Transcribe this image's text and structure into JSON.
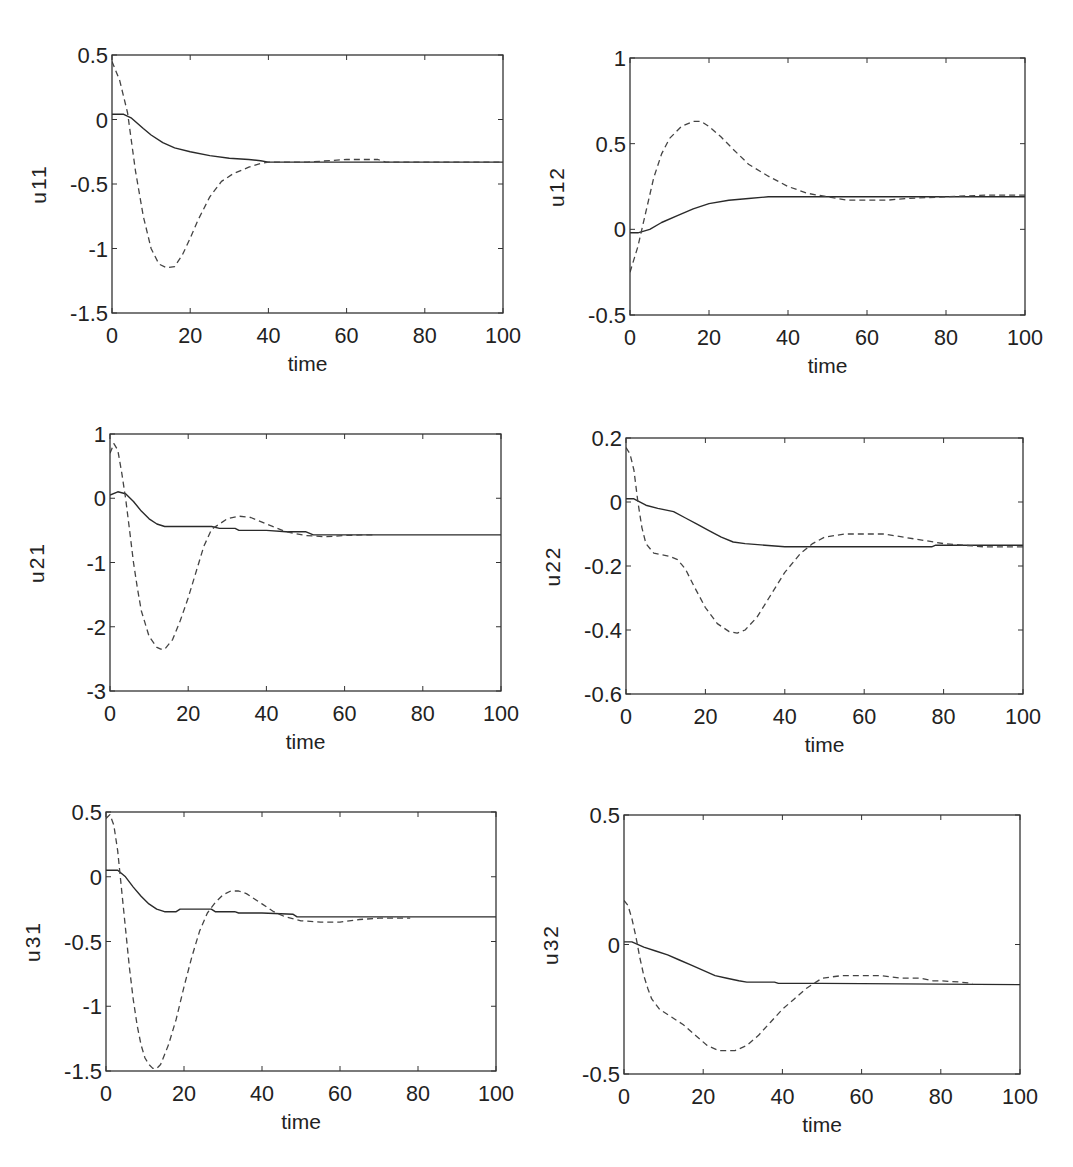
{
  "figure": {
    "background": "#ffffff",
    "line_color": "#2a2a2a",
    "dash_color": "#444444"
  },
  "chart_data": [
    {
      "id": "u11",
      "type": "line",
      "title": "",
      "xlabel": "time",
      "ylabel": "u11",
      "xlim": [
        0,
        100
      ],
      "ylim": [
        -1.5,
        0.5
      ],
      "xticks": [
        0,
        20,
        40,
        60,
        80,
        100
      ],
      "xtick_labels": [
        "0",
        "20",
        "40",
        "60",
        "80",
        "100"
      ],
      "yticks": [
        -1.5,
        -1,
        -0.5,
        0,
        0.5
      ],
      "ytick_labels": [
        "-1.5",
        "-1",
        "-0.5",
        "0",
        "0.5"
      ],
      "grid": false,
      "legend": null,
      "box": {
        "x0": 112,
        "y0": 55,
        "x1": 503,
        "y1": 313
      },
      "series": [
        {
          "name": "solid",
          "style": "solid",
          "x": [
            0,
            3,
            5,
            8,
            10,
            13,
            16,
            20,
            25,
            30,
            35,
            38,
            40,
            50,
            100
          ],
          "y": [
            0.04,
            0.04,
            0.01,
            -0.07,
            -0.12,
            -0.18,
            -0.22,
            -0.25,
            -0.28,
            -0.3,
            -0.31,
            -0.32,
            -0.33,
            -0.33,
            -0.33
          ]
        },
        {
          "name": "dashed",
          "style": "dashed",
          "x": [
            0,
            2,
            4,
            6,
            8,
            10,
            12,
            14,
            16,
            18,
            20,
            22,
            25,
            28,
            31,
            35,
            38,
            40,
            50,
            60,
            68,
            70,
            100
          ],
          "y": [
            0.45,
            0.3,
            0.05,
            -0.4,
            -0.75,
            -1.0,
            -1.12,
            -1.15,
            -1.14,
            -1.05,
            -0.92,
            -0.78,
            -0.6,
            -0.48,
            -0.42,
            -0.37,
            -0.34,
            -0.33,
            -0.33,
            -0.31,
            -0.31,
            -0.33,
            -0.33
          ]
        }
      ]
    },
    {
      "id": "u12",
      "type": "line",
      "title": "",
      "xlabel": "time",
      "ylabel": "u12",
      "xlim": [
        0,
        100
      ],
      "ylim": [
        -0.5,
        1
      ],
      "xticks": [
        0,
        20,
        40,
        60,
        80,
        100
      ],
      "xtick_labels": [
        "0",
        "20",
        "40",
        "60",
        "80",
        "100"
      ],
      "yticks": [
        -0.5,
        0,
        0.5,
        1
      ],
      "ytick_labels": [
        "-0.5",
        "0",
        "0.5",
        "1"
      ],
      "grid": false,
      "legend": null,
      "box": {
        "x0": 630,
        "y0": 58,
        "x1": 1025,
        "y1": 315
      },
      "series": [
        {
          "name": "solid",
          "style": "solid",
          "x": [
            0,
            2,
            5,
            8,
            12,
            16,
            20,
            25,
            30,
            35,
            40,
            50,
            100
          ],
          "y": [
            -0.02,
            -0.02,
            0.0,
            0.04,
            0.08,
            0.12,
            0.15,
            0.17,
            0.18,
            0.19,
            0.19,
            0.19,
            0.19
          ]
        },
        {
          "name": "dashed",
          "style": "dashed",
          "x": [
            0,
            2,
            4,
            6,
            8,
            10,
            13,
            16,
            18,
            20,
            23,
            26,
            30,
            35,
            40,
            45,
            50,
            55,
            60,
            65,
            70,
            80,
            90,
            100
          ],
          "y": [
            -0.25,
            -0.1,
            0.1,
            0.3,
            0.44,
            0.53,
            0.6,
            0.63,
            0.63,
            0.6,
            0.54,
            0.47,
            0.38,
            0.31,
            0.25,
            0.21,
            0.19,
            0.17,
            0.17,
            0.17,
            0.18,
            0.19,
            0.2,
            0.2
          ]
        }
      ]
    },
    {
      "id": "u21",
      "type": "line",
      "title": "",
      "xlabel": "time",
      "ylabel": "u21",
      "xlim": [
        0,
        100
      ],
      "ylim": [
        -3,
        1
      ],
      "xticks": [
        0,
        20,
        40,
        60,
        80,
        100
      ],
      "xtick_labels": [
        "0",
        "20",
        "40",
        "60",
        "80",
        "100"
      ],
      "yticks": [
        -3,
        -2,
        -1,
        0,
        1
      ],
      "ytick_labels": [
        "-3",
        "-2",
        "-1",
        "0",
        "1"
      ],
      "grid": false,
      "legend": null,
      "box": {
        "x0": 110,
        "y0": 434,
        "x1": 501,
        "y1": 691
      },
      "series": [
        {
          "name": "solid",
          "style": "solid",
          "x": [
            0,
            2,
            4,
            6,
            8,
            10,
            12,
            14,
            20,
            26,
            28,
            32,
            33,
            40,
            45,
            50,
            52,
            100
          ],
          "y": [
            0.05,
            0.1,
            0.07,
            -0.05,
            -0.2,
            -0.32,
            -0.4,
            -0.44,
            -0.44,
            -0.44,
            -0.47,
            -0.47,
            -0.5,
            -0.5,
            -0.52,
            -0.52,
            -0.57,
            -0.57
          ]
        },
        {
          "name": "dashed",
          "style": "dashed",
          "x": [
            0,
            1,
            2,
            3,
            4,
            5,
            6,
            7,
            8,
            10,
            12,
            13,
            14,
            16,
            18,
            20,
            22,
            24,
            26,
            28,
            30,
            33,
            36,
            40,
            45,
            50,
            55,
            60,
            65,
            68
          ],
          "y": [
            0.7,
            0.85,
            0.75,
            0.4,
            0.0,
            -0.5,
            -1.0,
            -1.4,
            -1.75,
            -2.15,
            -2.32,
            -2.35,
            -2.35,
            -2.2,
            -1.9,
            -1.55,
            -1.15,
            -0.75,
            -0.48,
            -0.4,
            -0.32,
            -0.28,
            -0.3,
            -0.4,
            -0.52,
            -0.58,
            -0.6,
            -0.58,
            -0.57,
            -0.57
          ]
        }
      ]
    },
    {
      "id": "u22",
      "type": "line",
      "title": "",
      "xlabel": "time",
      "ylabel": "u22",
      "xlim": [
        0,
        100
      ],
      "ylim": [
        -0.6,
        0.2
      ],
      "xticks": [
        0,
        20,
        40,
        60,
        80,
        100
      ],
      "xtick_labels": [
        "0",
        "20",
        "40",
        "60",
        "80",
        "100"
      ],
      "yticks": [
        -0.6,
        -0.4,
        -0.2,
        0,
        0.2
      ],
      "ytick_labels": [
        "-0.6",
        "-0.4",
        "-0.2",
        "0",
        "0.2"
      ],
      "grid": false,
      "legend": null,
      "box": {
        "x0": 626,
        "y0": 438,
        "x1": 1023,
        "y1": 694
      },
      "series": [
        {
          "name": "solid",
          "style": "solid",
          "x": [
            0,
            2,
            5,
            8,
            12,
            15,
            18,
            21,
            24,
            27,
            30,
            35,
            40,
            50,
            60,
            70,
            77,
            78,
            100
          ],
          "y": [
            0.01,
            0.01,
            -0.01,
            -0.02,
            -0.03,
            -0.05,
            -0.07,
            -0.09,
            -0.11,
            -0.125,
            -0.13,
            -0.135,
            -0.14,
            -0.14,
            -0.14,
            -0.14,
            -0.14,
            -0.135,
            -0.135
          ]
        },
        {
          "name": "dashed",
          "style": "dashed",
          "x": [
            0,
            1,
            2,
            3,
            4,
            5,
            7,
            9,
            11,
            13,
            15,
            17,
            20,
            23,
            26,
            28,
            30,
            33,
            36,
            40,
            44,
            47,
            50,
            55,
            60,
            65,
            70,
            75,
            80,
            85,
            90,
            100
          ],
          "y": [
            0.17,
            0.15,
            0.1,
            0.0,
            -0.08,
            -0.13,
            -0.16,
            -0.165,
            -0.17,
            -0.18,
            -0.21,
            -0.26,
            -0.33,
            -0.38,
            -0.405,
            -0.41,
            -0.4,
            -0.36,
            -0.3,
            -0.22,
            -0.16,
            -0.13,
            -0.11,
            -0.1,
            -0.1,
            -0.1,
            -0.11,
            -0.12,
            -0.13,
            -0.135,
            -0.14,
            -0.14
          ]
        }
      ]
    },
    {
      "id": "u31",
      "type": "line",
      "title": "",
      "xlabel": "time",
      "ylabel": "u31",
      "xlim": [
        0,
        100
      ],
      "ylim": [
        -1.5,
        0.5
      ],
      "xticks": [
        0,
        20,
        40,
        60,
        80,
        100
      ],
      "xtick_labels": [
        "0",
        "20",
        "40",
        "60",
        "80",
        "100"
      ],
      "yticks": [
        -1.5,
        -1,
        -0.5,
        0,
        0.5
      ],
      "ytick_labels": [
        "-1.5",
        "-1",
        "-0.5",
        "0",
        "0.5"
      ],
      "grid": false,
      "legend": null,
      "box": {
        "x0": 106,
        "y0": 812,
        "x1": 496,
        "y1": 1071
      },
      "series": [
        {
          "name": "solid",
          "style": "solid",
          "x": [
            0,
            3,
            5,
            7,
            9,
            11,
            13,
            15,
            18,
            19,
            27,
            28,
            33,
            34,
            40,
            48,
            49,
            60,
            100
          ],
          "y": [
            0.05,
            0.05,
            0.0,
            -0.08,
            -0.15,
            -0.21,
            -0.25,
            -0.27,
            -0.27,
            -0.25,
            -0.25,
            -0.27,
            -0.27,
            -0.28,
            -0.28,
            -0.29,
            -0.31,
            -0.31,
            -0.31
          ]
        },
        {
          "name": "dashed",
          "style": "dashed",
          "x": [
            0,
            1,
            2,
            3,
            4,
            5,
            6,
            7,
            8,
            9,
            10,
            11,
            12,
            13,
            14,
            16,
            18,
            20,
            22,
            24,
            26,
            28,
            30,
            32,
            34,
            36,
            38,
            40,
            43,
            46,
            50,
            55,
            60,
            65,
            70,
            78
          ],
          "y": [
            0.45,
            0.48,
            0.4,
            0.2,
            -0.1,
            -0.4,
            -0.7,
            -0.95,
            -1.15,
            -1.3,
            -1.4,
            -1.45,
            -1.48,
            -1.48,
            -1.45,
            -1.3,
            -1.1,
            -0.85,
            -0.62,
            -0.42,
            -0.28,
            -0.2,
            -0.14,
            -0.11,
            -0.11,
            -0.13,
            -0.17,
            -0.21,
            -0.27,
            -0.31,
            -0.34,
            -0.35,
            -0.35,
            -0.33,
            -0.32,
            -0.32
          ]
        }
      ]
    },
    {
      "id": "u32",
      "type": "line",
      "title": "",
      "xlabel": "time",
      "ylabel": "u32",
      "xlim": [
        0,
        100
      ],
      "ylim": [
        -0.5,
        0.5
      ],
      "xticks": [
        0,
        20,
        40,
        60,
        80,
        100
      ],
      "xtick_labels": [
        "0",
        "20",
        "40",
        "60",
        "80",
        "100"
      ],
      "yticks": [
        -0.5,
        0,
        0.5
      ],
      "ytick_labels": [
        "-0.5",
        "0",
        "0.5"
      ],
      "grid": false,
      "legend": null,
      "box": {
        "x0": 624,
        "y0": 815,
        "x1": 1020,
        "y1": 1074
      },
      "series": [
        {
          "name": "solid",
          "style": "solid",
          "x": [
            0,
            2,
            5,
            8,
            11,
            14,
            17,
            20,
            23,
            26,
            29,
            31,
            35,
            38,
            39,
            50,
            100
          ],
          "y": [
            0.01,
            0.01,
            -0.01,
            -0.025,
            -0.04,
            -0.06,
            -0.08,
            -0.1,
            -0.12,
            -0.13,
            -0.14,
            -0.145,
            -0.145,
            -0.145,
            -0.15,
            -0.15,
            -0.155
          ]
        },
        {
          "name": "dashed",
          "style": "dashed",
          "x": [
            0,
            1,
            2,
            3,
            4,
            5,
            6,
            7,
            9,
            12,
            15,
            18,
            21,
            24,
            26,
            28,
            31,
            34,
            37,
            40,
            43,
            46,
            50,
            55,
            60,
            65,
            70,
            75,
            78,
            80,
            85,
            88
          ],
          "y": [
            0.17,
            0.15,
            0.1,
            0.03,
            -0.05,
            -0.12,
            -0.17,
            -0.21,
            -0.25,
            -0.28,
            -0.31,
            -0.35,
            -0.39,
            -0.41,
            -0.41,
            -0.41,
            -0.39,
            -0.35,
            -0.3,
            -0.25,
            -0.21,
            -0.17,
            -0.13,
            -0.12,
            -0.12,
            -0.12,
            -0.13,
            -0.13,
            -0.14,
            -0.14,
            -0.145,
            -0.15
          ]
        }
      ]
    }
  ]
}
